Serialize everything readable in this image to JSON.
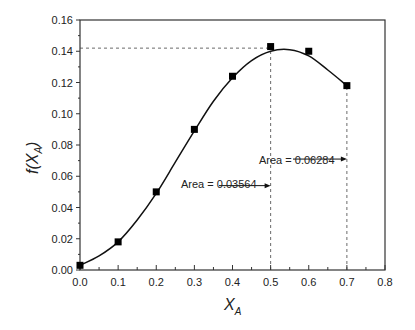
{
  "chart_data": {
    "type": "scatter",
    "title": "",
    "xlabel": "X_A",
    "ylabel": "f(X_A)",
    "xlim": [
      0.0,
      0.8
    ],
    "ylim": [
      0.0,
      0.16
    ],
    "xticks": [
      "0.0",
      "0.1",
      "0.2",
      "0.3",
      "0.4",
      "0.5",
      "0.6",
      "0.7",
      "0.8"
    ],
    "yticks": [
      "0.00",
      "0.02",
      "0.04",
      "0.06",
      "0.08",
      "0.10",
      "0.12",
      "0.14",
      "0.16"
    ],
    "grid": false,
    "legend": null,
    "series": [
      {
        "name": "data",
        "marker": "square",
        "x": [
          0.0,
          0.1,
          0.2,
          0.3,
          0.4,
          0.5,
          0.6,
          0.7
        ],
        "y": [
          0.003,
          0.018,
          0.05,
          0.09,
          0.124,
          0.143,
          0.14,
          0.118
        ]
      },
      {
        "name": "fitted curve",
        "style": "line",
        "x": [
          0.0,
          0.05,
          0.1,
          0.15,
          0.2,
          0.25,
          0.3,
          0.35,
          0.4,
          0.45,
          0.5,
          0.55,
          0.6,
          0.65,
          0.7
        ],
        "y": [
          0.003,
          0.009,
          0.018,
          0.032,
          0.049,
          0.069,
          0.089,
          0.108,
          0.123,
          0.134,
          0.14,
          0.141,
          0.137,
          0.128,
          0.118
        ]
      }
    ],
    "reference_lines": [
      {
        "type": "horizontal",
        "y": 0.142,
        "x_from": 0.0,
        "x_to": 0.5,
        "style": "dashed"
      },
      {
        "type": "vertical",
        "x": 0.5,
        "y_from": 0.0,
        "y_to": 0.142,
        "style": "dashed"
      },
      {
        "type": "vertical",
        "x": 0.7,
        "y_from": 0.0,
        "y_to": 0.118,
        "style": "dashed"
      }
    ],
    "annotations": [
      {
        "text": "Area = 0.03564",
        "arrow_to_x": 0.5,
        "arrow_y": 0.054
      },
      {
        "text": "Area = 0.06284",
        "arrow_to_x": 0.7,
        "arrow_y": 0.071
      }
    ]
  },
  "labels": {
    "ylabel_main": "f(X",
    "ylabel_sub": "A",
    "ylabel_close": ")",
    "xlabel_main": "X",
    "xlabel_sub": "A",
    "annot1": "Area = 0.03564",
    "annot2": "Area = 0.06284"
  }
}
